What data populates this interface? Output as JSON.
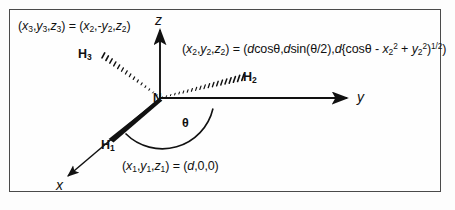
{
  "figure": {
    "background_color": "#fdfdfd",
    "frame_color": "#4a4a4a",
    "ink_color": "#111111"
  },
  "equations": {
    "h3_coords": {
      "lhs_x": "x",
      "lhs_x_sub": "3",
      "lhs_y": "y",
      "lhs_y_sub": "3",
      "lhs_z": "z",
      "lhs_z_sub": "3",
      "rhs_x": "x",
      "rhs_x_sub": "2",
      "rhs_y": "-y",
      "rhs_y_sub": "2",
      "rhs_z": "z",
      "rhs_z_sub": "2",
      "plain": "(x3,y3,z3) = (x2,-y2,z2)"
    },
    "h2_coords": {
      "plain": "(x2,y2,z2) = (dcosθ,dsin(θ/2),d{cosθ - x2^2 + y2^2}^1/2)",
      "term_1": "dcosθ",
      "term_2": "dsin(θ/2)",
      "term_3": "d{cosθ - x2² + y2²}¹ᐟ²"
    },
    "h1_coords": {
      "lhs": "(x1,y1,z1)",
      "rhs": "(d,0,0)",
      "plain": "(x1,y1,z1) = (d,0,0)"
    }
  },
  "axes": {
    "x_label": "x",
    "y_label": "y",
    "z_label": "z"
  },
  "atoms": {
    "center": "N",
    "h1": "H",
    "h1_sub": "1",
    "h2": "H",
    "h2_sub": "2",
    "h3": "H",
    "h3_sub": "3"
  },
  "angle": {
    "symbol": "θ"
  },
  "bonds": {
    "h1_style": "solid-wedge",
    "h2_style": "hashed-wedge",
    "h3_style": "hashed-wedge"
  }
}
